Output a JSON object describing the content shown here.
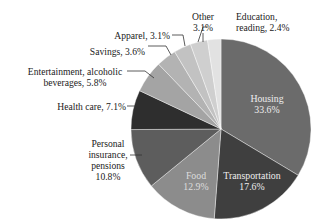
{
  "chart_data": {
    "type": "pie",
    "title": "",
    "start_angle_deg": 0,
    "direction": "clockwise",
    "slices": [
      {
        "label": "Housing",
        "value": 33.6,
        "color": "#6b6b6b"
      },
      {
        "label": "Transportation",
        "value": 17.6,
        "color": "#3f3f3f"
      },
      {
        "label": "Food",
        "value": 12.9,
        "color": "#8c8c8c"
      },
      {
        "label": "Personal insurance, pensions",
        "value": 10.8,
        "color": "#5d5d5d"
      },
      {
        "label": "Health care",
        "value": 7.1,
        "color": "#2e2e2e"
      },
      {
        "label": "Entertainment, alcoholic beverages",
        "value": 5.8,
        "color": "#a4a4a4"
      },
      {
        "label": "Savings",
        "value": 3.6,
        "color": "#b3b3b3"
      },
      {
        "label": "Apparel",
        "value": 3.1,
        "color": "#c2c2c2"
      },
      {
        "label": "Other",
        "value": 3.1,
        "color": "#cfcfcf"
      },
      {
        "label": "Education, reading",
        "value": 2.4,
        "color": "#e2e2e2"
      }
    ]
  },
  "labels": {
    "housing": {
      "name": "Housing",
      "pct": "33.6%"
    },
    "transportation": {
      "name": "Transportation",
      "pct": "17.6%"
    },
    "food": {
      "name": "Food",
      "pct": "12.9%"
    },
    "insurance": {
      "l1": "Personal",
      "l2": "insurance,",
      "l3": "pensions",
      "l4": "10.8%"
    },
    "health": "Health care, 7.1%",
    "entertainment": {
      "l1": "Entertainment, alcoholic",
      "l2": "beverages, 5.8%"
    },
    "savings": "Savings, 3.6%",
    "apparel": "Apparel, 3.1%",
    "other": {
      "l1": "Other",
      "l2": "3.1%"
    },
    "education": {
      "l1": "Education,",
      "l2": "reading, 2.4%"
    }
  }
}
